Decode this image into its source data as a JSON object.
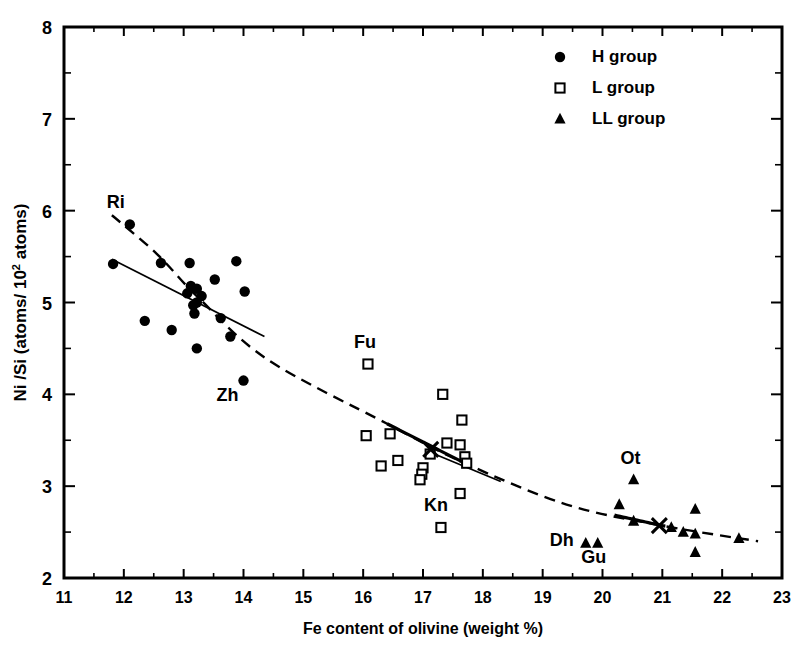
{
  "chart_data": {
    "type": "scatter",
    "title": "",
    "xlabel": "Fe content of olivine  (weight %)",
    "ylabel_line1": "Ni /Si",
    "ylabel_line2": "(atoms/ 10",
    "ylabel_exp": "2",
    "ylabel_line3": "atoms)",
    "ylabel_full": "Ni /Si  (atoms/ 10² atoms)",
    "xlim": [
      11,
      23
    ],
    "ylim": [
      2,
      8
    ],
    "xticks": [
      11,
      12,
      13,
      14,
      15,
      16,
      17,
      18,
      19,
      20,
      21,
      22,
      23
    ],
    "yticks": [
      2,
      3,
      4,
      5,
      6,
      7,
      8
    ],
    "xminor_step": 0.5,
    "yminor_step": 0.5,
    "grid": false,
    "legend_position": "top-right",
    "frame_color": "#000000",
    "marker_color": "#000000",
    "series": [
      {
        "name": "H group",
        "marker": "filled-circle",
        "points": [
          {
            "x": 12.1,
            "y": 5.85
          },
          {
            "x": 11.82,
            "y": 5.42
          },
          {
            "x": 12.62,
            "y": 5.43
          },
          {
            "x": 13.1,
            "y": 5.43
          },
          {
            "x": 13.88,
            "y": 5.45
          },
          {
            "x": 13.52,
            "y": 5.25
          },
          {
            "x": 14.02,
            "y": 5.12
          },
          {
            "x": 13.12,
            "y": 5.18
          },
          {
            "x": 13.22,
            "y": 5.15
          },
          {
            "x": 13.06,
            "y": 5.1
          },
          {
            "x": 13.3,
            "y": 5.07
          },
          {
            "x": 13.22,
            "y": 5.0
          },
          {
            "x": 13.16,
            "y": 4.97
          },
          {
            "x": 13.18,
            "y": 4.88
          },
          {
            "x": 13.62,
            "y": 4.83
          },
          {
            "x": 12.35,
            "y": 4.8
          },
          {
            "x": 12.8,
            "y": 4.7
          },
          {
            "x": 13.78,
            "y": 4.63
          },
          {
            "x": 13.22,
            "y": 4.5
          },
          {
            "x": 14.0,
            "y": 4.15
          }
        ],
        "labels": [
          {
            "text": "Ri",
            "x": 12.1,
            "y": 5.85,
            "dx": -14,
            "dy": -16
          },
          {
            "text": "Zh",
            "x": 14.0,
            "y": 4.15,
            "dx": -16,
            "dy": 20
          }
        ]
      },
      {
        "name": "L group",
        "marker": "open-square",
        "points": [
          {
            "x": 16.08,
            "y": 4.33
          },
          {
            "x": 17.33,
            "y": 4.0
          },
          {
            "x": 17.65,
            "y": 3.72
          },
          {
            "x": 16.45,
            "y": 3.57
          },
          {
            "x": 16.05,
            "y": 3.55
          },
          {
            "x": 17.4,
            "y": 3.47
          },
          {
            "x": 17.62,
            "y": 3.45
          },
          {
            "x": 17.12,
            "y": 3.35
          },
          {
            "x": 17.7,
            "y": 3.32
          },
          {
            "x": 16.58,
            "y": 3.28
          },
          {
            "x": 17.73,
            "y": 3.25
          },
          {
            "x": 16.3,
            "y": 3.22
          },
          {
            "x": 17.0,
            "y": 3.2
          },
          {
            "x": 16.98,
            "y": 3.13
          },
          {
            "x": 16.95,
            "y": 3.07
          },
          {
            "x": 17.62,
            "y": 2.92
          },
          {
            "x": 17.3,
            "y": 2.55
          }
        ],
        "labels": [
          {
            "text": "Fu",
            "x": 16.08,
            "y": 4.33,
            "dx": -3,
            "dy": -16
          },
          {
            "text": "Kn",
            "x": 17.3,
            "y": 2.55,
            "dx": -5,
            "dy": -16
          }
        ]
      },
      {
        "name": "LL group",
        "marker": "filled-triangle",
        "points": [
          {
            "x": 20.52,
            "y": 3.07
          },
          {
            "x": 20.28,
            "y": 2.8
          },
          {
            "x": 21.55,
            "y": 2.75
          },
          {
            "x": 20.52,
            "y": 2.62
          },
          {
            "x": 21.15,
            "y": 2.55
          },
          {
            "x": 21.35,
            "y": 2.5
          },
          {
            "x": 21.55,
            "y": 2.48
          },
          {
            "x": 22.28,
            "y": 2.43
          },
          {
            "x": 19.72,
            "y": 2.38
          },
          {
            "x": 19.92,
            "y": 2.38
          },
          {
            "x": 21.55,
            "y": 2.28
          }
        ],
        "labels": [
          {
            "text": "Ot",
            "x": 20.52,
            "y": 3.07,
            "dx": -3,
            "dy": -16
          },
          {
            "text": "Dh",
            "x": 19.72,
            "y": 2.38,
            "dx": -24,
            "dy": 3
          },
          {
            "text": "Gu",
            "x": 19.92,
            "y": 2.38,
            "dx": -4,
            "dy": 20
          }
        ]
      }
    ],
    "mean_markers": [
      {
        "label": "L group mean",
        "x": 17.13,
        "y": 3.4
      },
      {
        "label": "LL group mean",
        "x": 20.95,
        "y": 2.57
      }
    ],
    "trend_lines": [
      {
        "name": "overall-curve",
        "style": "dashed-with-solid-segments",
        "vertices": [
          {
            "x": 11.8,
            "y": 5.95
          },
          {
            "x": 12.55,
            "y": 5.53
          },
          {
            "x": 13.25,
            "y": 5.05
          },
          {
            "x": 14.4,
            "y": 4.38
          },
          {
            "x": 16.4,
            "y": 3.68
          },
          {
            "x": 17.7,
            "y": 3.25
          },
          {
            "x": 19.4,
            "y": 2.8
          },
          {
            "x": 21.0,
            "y": 2.57
          },
          {
            "x": 22.6,
            "y": 2.4
          }
        ],
        "solid_ranges": [
          [
            16.4,
            17.75
          ],
          [
            20.2,
            21.05
          ]
        ]
      },
      {
        "name": "h-group-regression",
        "style": "solid",
        "x1": 11.8,
        "y1": 5.47,
        "x2": 14.35,
        "y2": 4.63
      },
      {
        "name": "l-group-regression",
        "style": "solid",
        "x1": 17.12,
        "y1": 3.37,
        "x2": 18.3,
        "y2": 3.05
      }
    ]
  },
  "legend": {
    "items": [
      {
        "label": "H group",
        "marker": "filled-circle"
      },
      {
        "label": "L group",
        "marker": "open-square"
      },
      {
        "label": "LL group",
        "marker": "filled-triangle"
      }
    ]
  }
}
